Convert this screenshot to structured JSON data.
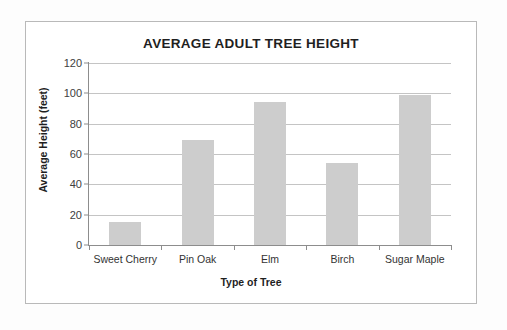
{
  "chart_data": {
    "type": "bar",
    "title": "AVERAGE ADULT TREE HEIGHT",
    "xlabel": "Type of Tree",
    "ylabel": "Average Height (feet)",
    "categories": [
      "Sweet Cherry",
      "Pin Oak",
      "Elm",
      "Birch",
      "Sugar Maple"
    ],
    "values": [
      15,
      69,
      94,
      54,
      99
    ],
    "ylim": [
      0,
      120
    ],
    "ytick_labels": [
      "0",
      "20",
      "40",
      "60",
      "80",
      "100",
      "120"
    ],
    "ytick_values": [
      0,
      20,
      40,
      60,
      80,
      100,
      120
    ],
    "grid": "horizontal",
    "legend": "none",
    "bar_color": "#cdcdcd",
    "gridline_color": "#c4c4c4",
    "axis_color": "#8d8d8d",
    "text_color": "#1f1f1f",
    "background_color": "#ffffff"
  }
}
